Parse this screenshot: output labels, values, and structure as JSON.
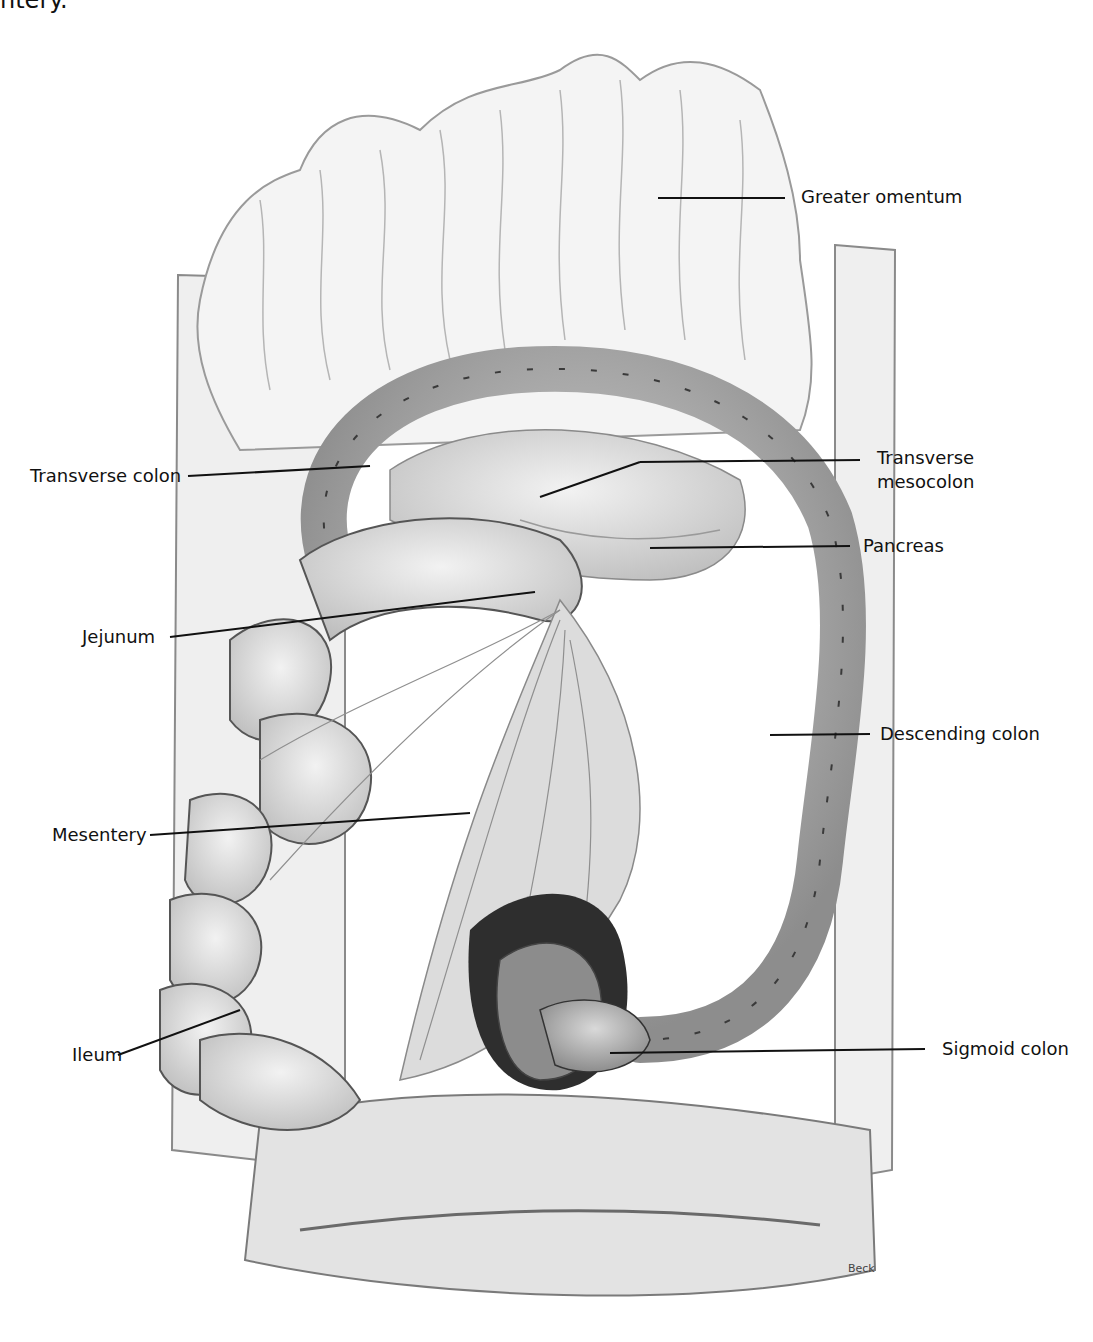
{
  "figure": {
    "top_caption_fragment": "ntery.",
    "credit": "Beck"
  },
  "labels": {
    "greater_omentum": "Greater omentum",
    "transverse_colon": "Transverse colon",
    "transverse_mesocolon": "Transverse mesocolon",
    "pancreas": "Pancreas",
    "jejunum": "Jejunum",
    "descending_colon": "Descending colon",
    "mesentery": "Mesentery",
    "ileum": "Ileum",
    "sigmoid_colon": "Sigmoid colon"
  },
  "colors": {
    "tissue_light": "#e6e6e6",
    "tissue_mid": "#bdbdbd",
    "tissue_dark": "#7a7a7a",
    "outline": "#2a2a2a",
    "leader_line": "#111111"
  }
}
